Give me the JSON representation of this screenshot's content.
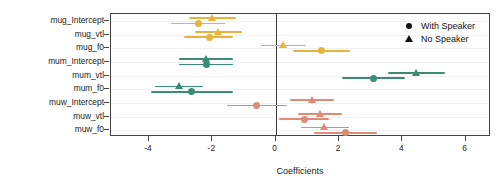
{
  "chart_data": {
    "type": "scatter",
    "title": "",
    "xlabel": "Coefficients",
    "ylabel": "",
    "xlim": [
      -5.2,
      6.8
    ],
    "xticks": [
      -4,
      -2,
      0,
      2,
      4,
      6
    ],
    "xticklabels": [
      "-4",
      "-2",
      "0",
      "2",
      "4",
      "6"
    ],
    "grid": true,
    "zero_reference_line": 0,
    "legend_position": "top-right",
    "categories": [
      "mug_Intercept",
      "mug_vtl",
      "mug_f0",
      "mum_Intercept",
      "mum_vtl",
      "mum_f0",
      "muw_Intercept",
      "muw_vtl",
      "muw_f0"
    ],
    "group_colors": {
      "mug": "#E8B33C",
      "mum": "#3A8C72",
      "muw": "#E08A78"
    },
    "series": [
      {
        "name": "With Speaker",
        "marker": "circle",
        "values": [
          -2.45,
          -2.1,
          1.45,
          -2.2,
          3.1,
          -2.65,
          -0.6,
          0.9,
          2.2
        ],
        "ci_low": [
          -3.3,
          -2.9,
          0.55,
          -3.05,
          2.1,
          -3.95,
          -1.55,
          0.1,
          1.2
        ],
        "ci_high": [
          -1.6,
          -1.35,
          2.35,
          -1.35,
          4.1,
          -1.35,
          0.35,
          1.7,
          3.2
        ]
      },
      {
        "name": "No Speaker",
        "marker": "triangle",
        "values": [
          -2.0,
          -1.8,
          0.25,
          -2.2,
          4.45,
          -3.05,
          1.15,
          1.4,
          1.55
        ],
        "ci_low": [
          -2.75,
          -2.55,
          -0.45,
          -3.05,
          3.55,
          -3.8,
          0.45,
          0.7,
          0.8
        ],
        "ci_high": [
          -1.25,
          -1.05,
          0.95,
          -1.35,
          5.35,
          -2.3,
          1.85,
          2.1,
          2.3
        ]
      }
    ]
  },
  "legend": {
    "items": [
      {
        "label": "With Speaker",
        "glyph": "circle-marker-icon"
      },
      {
        "label": "No Speaker",
        "glyph": "triangle-marker-icon"
      }
    ]
  }
}
